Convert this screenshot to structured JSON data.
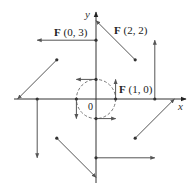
{
  "diagram": {
    "type": "vector-field",
    "origin_px": [
      96,
      99
    ],
    "unit_px": 19.6,
    "axes": {
      "x_label": "x",
      "y_label": "y",
      "origin_label": "0"
    },
    "circle": {
      "radius": 1,
      "style": "dashed"
    },
    "labels": [
      {
        "name": "F",
        "args": "(0, 3)",
        "point": [
          0,
          3
        ]
      },
      {
        "name": "F",
        "args": "(2, 2)",
        "point": [
          2,
          2
        ]
      },
      {
        "name": "F",
        "args": "(1, 0)",
        "point": [
          1,
          0
        ]
      }
    ],
    "vectors": [
      {
        "at": [
          0,
          3
        ],
        "v": [
          -3,
          0
        ]
      },
      {
        "at": [
          2,
          2
        ],
        "v": [
          -2,
          2
        ]
      },
      {
        "at": [
          1,
          0
        ],
        "v": [
          0,
          1
        ]
      },
      {
        "at": [
          0,
          1
        ],
        "v": [
          -1,
          0
        ]
      },
      {
        "at": [
          -1,
          0
        ],
        "v": [
          0,
          -1
        ]
      },
      {
        "at": [
          0,
          -1
        ],
        "v": [
          1,
          0
        ]
      },
      {
        "at": [
          3,
          0
        ],
        "v": [
          0,
          3
        ]
      },
      {
        "at": [
          -3,
          0
        ],
        "v": [
          0,
          -3
        ]
      },
      {
        "at": [
          -2,
          2
        ],
        "v": [
          -2,
          -2
        ]
      },
      {
        "at": [
          2,
          -2
        ],
        "v": [
          2,
          2
        ]
      },
      {
        "at": [
          -2,
          -2
        ],
        "v": [
          2,
          -2
        ]
      },
      {
        "at": [
          0,
          -3
        ],
        "v": [
          3,
          0
        ]
      }
    ],
    "colors": {
      "line": "#555555",
      "dot": "#333333",
      "text": "#222222"
    }
  }
}
